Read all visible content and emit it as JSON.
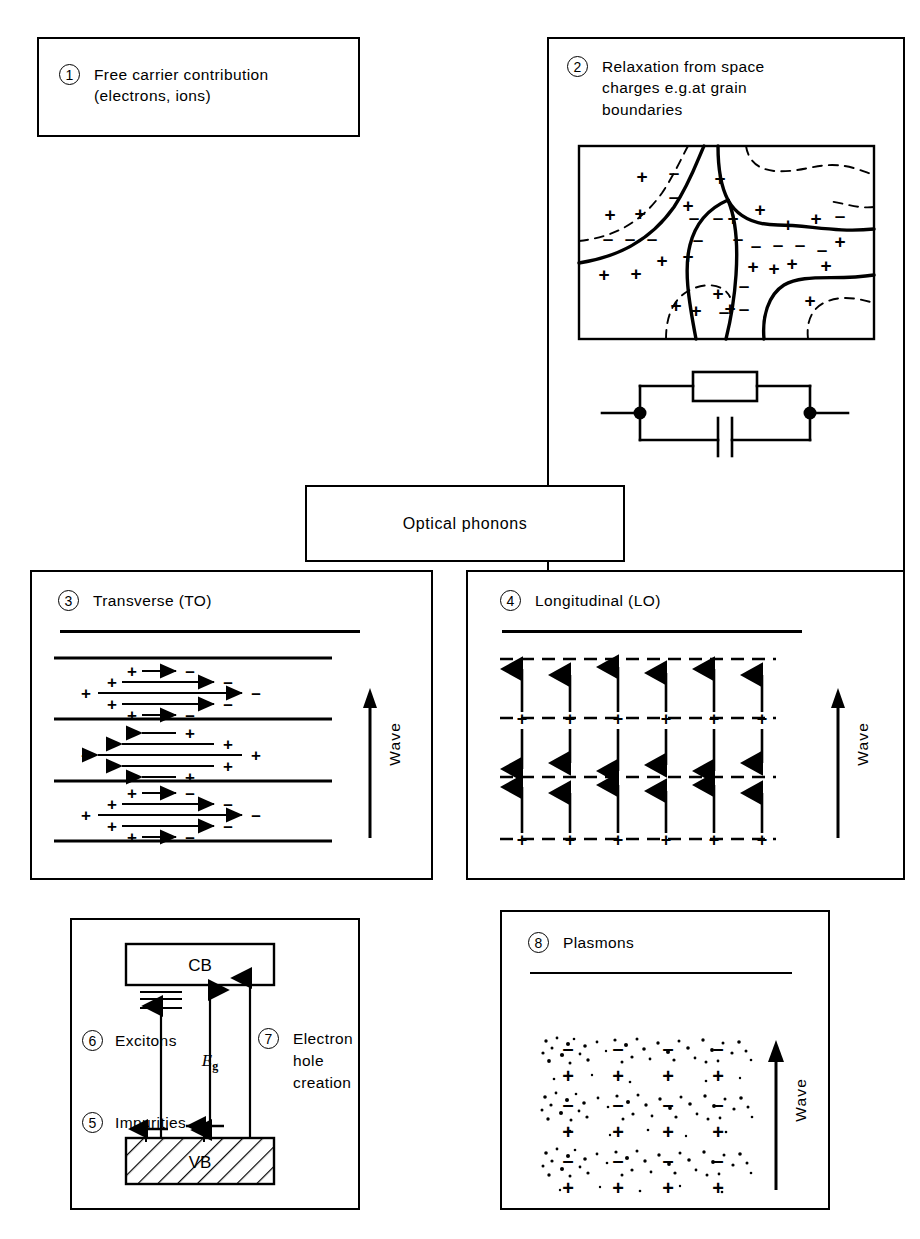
{
  "figure": {
    "background": "#ffffff",
    "ink": "#000000"
  },
  "boxes": [
    {
      "id": 1,
      "number": "1",
      "label": "Free carrier contribution\n(electrons, ions)",
      "rect": [
        37,
        37,
        323,
        100
      ]
    },
    {
      "id": 2,
      "number": "2",
      "label": "Relaxation from space\ncharges e.g.at grain\nboundaries",
      "rect": [
        547,
        37,
        358,
        663
      ]
    },
    {
      "id": 3,
      "number": "3",
      "label": "Transverse (TO)",
      "rect": [
        30,
        570,
        403,
        310
      ],
      "wave_label": "Wave"
    },
    {
      "id": 4,
      "number": "4",
      "label": "Longitudinal (LO)",
      "rect": [
        466,
        570,
        439,
        310
      ],
      "wave_label": "Wave"
    },
    {
      "id": 5,
      "number": "5",
      "label": "Impurities"
    },
    {
      "id": 6,
      "number": "6",
      "label": "Excitons"
    },
    {
      "id": 7,
      "number": "7",
      "label": "Electron\nhole\ncreation"
    },
    {
      "id": 8,
      "number": "8",
      "label": "Plasmons",
      "rect": [
        500,
        910,
        330,
        300
      ],
      "wave_label": "Wave"
    }
  ],
  "band_box": {
    "rect": [
      70,
      918,
      290,
      292
    ],
    "conduction_band": "CB",
    "valence_band": "VB",
    "gap_label_main": "E",
    "gap_label_sub": "g"
  },
  "optical_phonons": {
    "label": "Optical phonons",
    "rect": [
      305,
      485,
      320,
      77
    ]
  },
  "grain_boundary_panel": {
    "rect": [
      578,
      145,
      297,
      195
    ],
    "plus_sign": "+",
    "minus_sign": "–",
    "plus_positions": [
      [
        64,
        31
      ],
      [
        110,
        60
      ],
      [
        32,
        69
      ],
      [
        62,
        68
      ],
      [
        84,
        115
      ],
      [
        58,
        128
      ],
      [
        26,
        129
      ],
      [
        110,
        111
      ],
      [
        142,
        33
      ],
      [
        155,
        73
      ],
      [
        182,
        64
      ],
      [
        210,
        79
      ],
      [
        175,
        121
      ],
      [
        140,
        148
      ],
      [
        196,
        123
      ],
      [
        214,
        118
      ],
      [
        238,
        73
      ],
      [
        118,
        165
      ],
      [
        152,
        163
      ],
      [
        248,
        120
      ],
      [
        232,
        155
      ],
      [
        98,
        160
      ],
      [
        262,
        96
      ]
    ],
    "minus_positions": [
      [
        96,
        27
      ],
      [
        96,
        51
      ],
      [
        116,
        72
      ],
      [
        140,
        72
      ],
      [
        120,
        94
      ],
      [
        30,
        93
      ],
      [
        52,
        93
      ],
      [
        74,
        93
      ],
      [
        160,
        93
      ],
      [
        178,
        100
      ],
      [
        200,
        99
      ],
      [
        222,
        99
      ],
      [
        244,
        104
      ],
      [
        166,
        140
      ],
      [
        166,
        163
      ],
      [
        146,
        166
      ],
      [
        262,
        70
      ]
    ]
  },
  "circuit": {
    "rect": [
      600,
      368,
      250,
      85
    ],
    "components": [
      "resistor",
      "capacitor",
      "terminal-left",
      "terminal-right"
    ]
  },
  "to_panel": {
    "rows": [
      {
        "direction": "right",
        "tail_sign": "+",
        "head_sign": "–"
      },
      {
        "direction": "left",
        "tail_sign": "+",
        "head_sign": "–"
      },
      {
        "direction": "right",
        "tail_sign": "+",
        "head_sign": "–"
      }
    ],
    "arrows_per_row": 5
  },
  "lo_panel": {
    "columns": 6,
    "rows": [
      {
        "kind": "dashed-line",
        "sign": "–"
      },
      {
        "kind": "arrows",
        "direction": "up"
      },
      {
        "kind": "dashed-line",
        "sign": "+"
      },
      {
        "kind": "arrows",
        "direction": "down"
      },
      {
        "kind": "dashed-line",
        "sign": "–"
      },
      {
        "kind": "arrows",
        "direction": "up"
      },
      {
        "kind": "dashed-line",
        "sign": "+"
      }
    ]
  },
  "plasmon_panel": {
    "rect": [
      540,
      1035,
      215,
      165
    ],
    "columns": 4,
    "row_signs": [
      "–",
      "+",
      "–",
      "+",
      "–",
      "+"
    ]
  }
}
